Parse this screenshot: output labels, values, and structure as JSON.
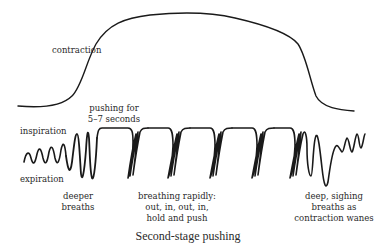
{
  "figure": {
    "caption": "Second-stage pushing",
    "contraction_label": "contraction",
    "axis_labels": {
      "inspiration": "inspiration",
      "expiration": "expiration"
    },
    "annotations": {
      "pushing": [
        "pushing for",
        "5–7 seconds"
      ],
      "deeper_breaths": [
        "deeper",
        "breaths"
      ],
      "breathing_rapidly": [
        "breathing rapidly:",
        "out, in, out, in,",
        "hold and push"
      ],
      "sighing": [
        "deep, sighing",
        "breaths as",
        "contraction wanes"
      ]
    },
    "colors": {
      "stroke": "#1a1a1a",
      "text": "#2a2a2a",
      "background": "#ffffff"
    }
  }
}
